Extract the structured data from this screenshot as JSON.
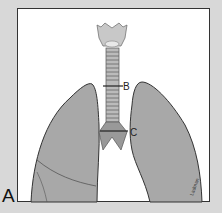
{
  "figure": {
    "panel_label": "A",
    "annotations": [
      {
        "id": "B",
        "label": "B"
      },
      {
        "id": "C",
        "label": "C"
      }
    ],
    "signature": "Ladman",
    "colors": {
      "background": "#d8d8d8",
      "frame": "#ffffff",
      "lung": "#a8a8a8",
      "outline": "#333333"
    }
  }
}
